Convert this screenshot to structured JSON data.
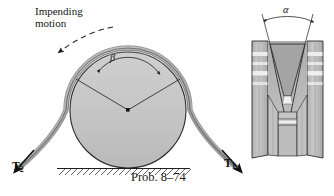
{
  "figure": {
    "caption": "Prob. 8–74",
    "drum_diagram": {
      "motion_label_line1": "Impending",
      "motion_label_line2": "motion",
      "motion_arrow": "curved-dashed-arrow-counterclockwise",
      "wrap_angle_symbol": "β",
      "tension_left_symbol": "T",
      "tension_left_subscript": "2",
      "tension_right_symbol": "T",
      "tension_right_subscript": "1",
      "ground_symbol": "hatched-ground-line",
      "center_marker": "center-dot"
    },
    "groove_detail": {
      "groove_angle_symbol": "α",
      "view": "v-groove-cross-section"
    },
    "colors": {
      "drum_fill": "#c6c6c6",
      "belt_fill": "#b4b4b4",
      "groove_fill": "#b0b0b0",
      "flange_fill": "#c0c0c0",
      "outline": "#1f1f1f",
      "arrow": "#111111",
      "background": "#ffffff"
    }
  }
}
